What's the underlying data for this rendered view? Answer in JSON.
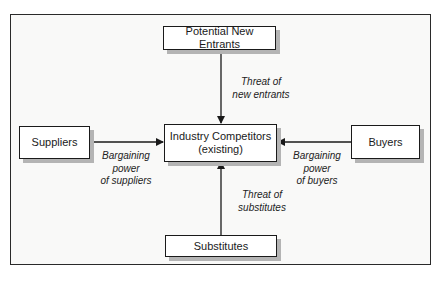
{
  "diagram": {
    "nodes": {
      "entrants": "Potential New Entrants",
      "industry_line1": "Industry Competitors",
      "industry_line2": "(existing)",
      "suppliers": "Suppliers",
      "buyers": "Buyers",
      "substitutes": "Substitutes"
    },
    "edges": {
      "entrants": {
        "line1": "Threat of",
        "line2": "new entrants"
      },
      "suppliers": {
        "line1": "Bargaining",
        "line2": "power",
        "line3": "of suppliers"
      },
      "buyers": {
        "line1": "Bargaining",
        "line2": "power",
        "line3": "of buyers"
      },
      "substitutes": {
        "line1": "Threat of",
        "line2": "substitutes"
      }
    }
  }
}
